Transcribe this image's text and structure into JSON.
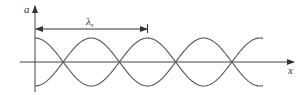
{
  "diagram": {
    "type": "standing-wave-envelope",
    "y_axis_label": "a",
    "x_axis_label": "x",
    "wavelength_label": "λ",
    "wavelength_subscript": "s",
    "colors": {
      "line": "#555555",
      "axis": "#444444",
      "text": "#333333"
    },
    "geometry": {
      "origin_x": 35,
      "axis_y": 62,
      "amplitude": 24,
      "period": 112.5,
      "wave_end_x": 263
    }
  }
}
